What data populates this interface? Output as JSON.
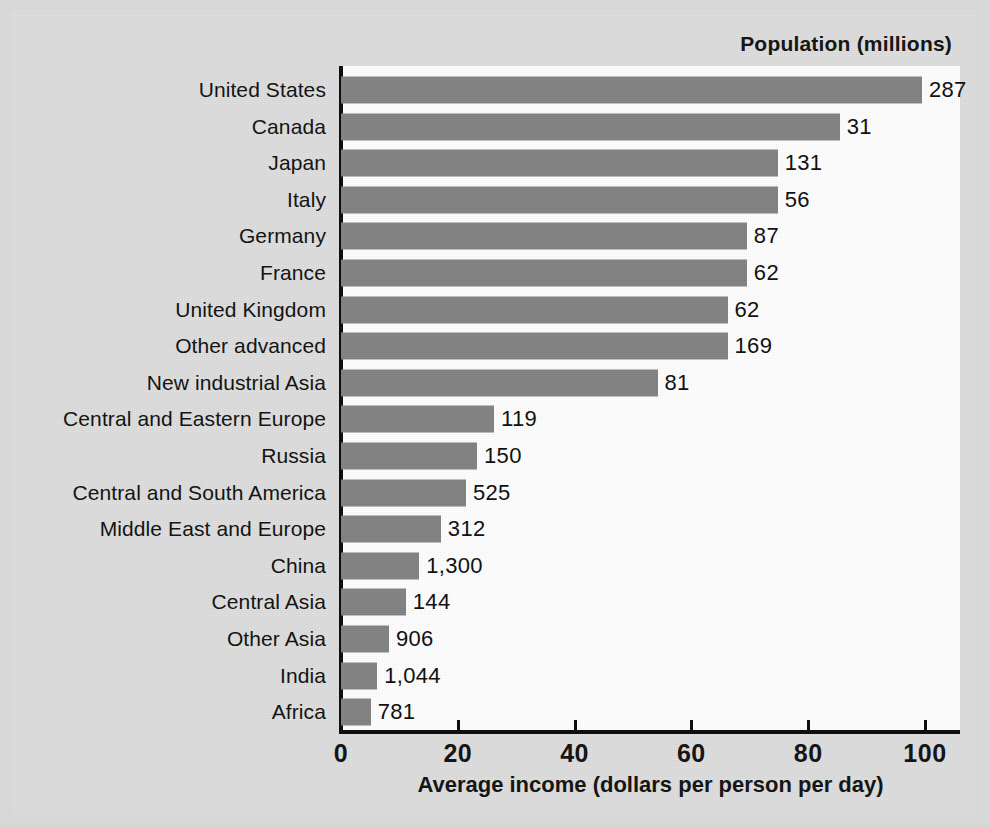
{
  "figure": {
    "population_header": "Population (millions)",
    "x_axis_title": "Average income (dollars per person per day)"
  },
  "chart_data": {
    "type": "bar",
    "orientation": "horizontal",
    "title": "",
    "xlabel": "Average income (dollars per person per day)",
    "ylabel": "",
    "xlim": [
      0,
      106
    ],
    "xticks": [
      0,
      20,
      40,
      60,
      80,
      100
    ],
    "xtick_labels": [
      "0",
      "20",
      "40",
      "60",
      "80",
      "100"
    ],
    "grid": false,
    "legend": "none",
    "bar_color": "#838383",
    "panel_color": "#ffffff",
    "background_color": "#dcdcdc",
    "value_label_header": "Population (millions)",
    "categories": [
      "United States",
      "Canada",
      "Japan",
      "Italy",
      "Germany",
      "France",
      "United Kingdom",
      "Other advanced",
      "New industrial Asia",
      "Central and Eastern Europe",
      "Russia",
      "Central and South America",
      "Middle East and Europe",
      "China",
      "Central Asia",
      "Other Asia",
      "India",
      "Africa"
    ],
    "values": [
      99.5,
      85.4,
      74.8,
      74.8,
      69.5,
      69.5,
      66.2,
      66.2,
      54.2,
      26.2,
      23.3,
      21.4,
      17.1,
      13.4,
      11.1,
      8.2,
      6.2,
      5.1
    ],
    "population_labels": [
      "287",
      "31",
      "131",
      "56",
      "87",
      "62",
      "62",
      "169",
      "81",
      "119",
      "150",
      "525",
      "312",
      "1,300",
      "144",
      "906",
      "1,044",
      "781"
    ],
    "population_millions": [
      287,
      31,
      131,
      56,
      87,
      62,
      62,
      169,
      81,
      119,
      150,
      525,
      312,
      1300,
      144,
      906,
      1044,
      781
    ]
  }
}
